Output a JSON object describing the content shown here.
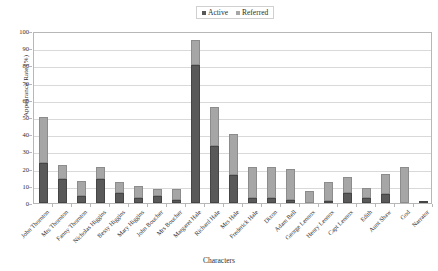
{
  "legend": {
    "position": "top-center",
    "entries": [
      {
        "label": "Active",
        "color": "#595959"
      },
      {
        "label": "Referred",
        "color": "#a6a6a6"
      }
    ]
  },
  "axes": {
    "ylabel": "Appearance Rate (%)",
    "xlabel": "Characters",
    "yticks": [
      0,
      10,
      20,
      30,
      40,
      50,
      60,
      70,
      80,
      90,
      100
    ],
    "ymin": 0,
    "ymax": 100
  },
  "chart_data": {
    "type": "bar",
    "title": "",
    "subtitle": "",
    "xlabel": "Characters",
    "ylabel": "Appearance Rate (%)",
    "ylim": [
      0,
      100
    ],
    "grid": true,
    "stacked": true,
    "legend_position": "top-center",
    "categories": [
      "John Thornton",
      "Mrs Thornton",
      "Fanny Thornton",
      "Nicholas Higgins",
      "Bessy Higgins",
      "Mary Higgins",
      "John Boucher",
      "Mrs Boucher",
      "Margaret Hale",
      "Richard Hale",
      "Mrs Hale",
      "Frederick Hale",
      "Dixon",
      "Adam Bell",
      "George Lennox",
      "Henry Lennox",
      "Capt Lennox",
      "Edith",
      "Aunt Shaw",
      "God",
      "Narrator"
    ],
    "series": [
      {
        "name": "Active",
        "color": "#595959",
        "values": [
          23,
          14,
          4,
          14,
          6,
          3,
          4,
          2,
          80,
          33,
          16,
          3,
          3,
          2,
          0,
          1,
          6,
          3,
          5,
          0,
          1
        ]
      },
      {
        "name": "Referred",
        "color": "#a6a6a6",
        "values": [
          27,
          8,
          9,
          7,
          6,
          7,
          4,
          6,
          15,
          23,
          24,
          18,
          18,
          18,
          7,
          11,
          9,
          6,
          12,
          21,
          0
        ]
      }
    ],
    "totals": [
      50,
      22,
      13,
      21,
      12,
      10,
      8,
      8,
      95,
      56,
      40,
      21,
      21,
      20,
      7,
      12,
      15,
      9,
      17,
      21,
      1
    ]
  }
}
